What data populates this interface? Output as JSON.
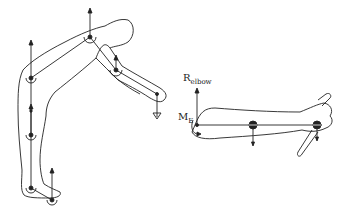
{
  "diagram": {
    "figures": [
      {
        "name": "bent-over-body",
        "description": "Stick-figure human bent forward with arm extended, joint centers marked with reaction forces"
      },
      {
        "name": "forearm-hand-segment",
        "description": "Free-body diagram of forearm and hand holding an object"
      }
    ],
    "labels": {
      "r_elbow_main": "R",
      "r_elbow_sub": "elbow",
      "m_e_main": "M",
      "m_e_sub": "E"
    },
    "colors": {
      "stroke": "#222222",
      "background": "#ffffff"
    }
  }
}
